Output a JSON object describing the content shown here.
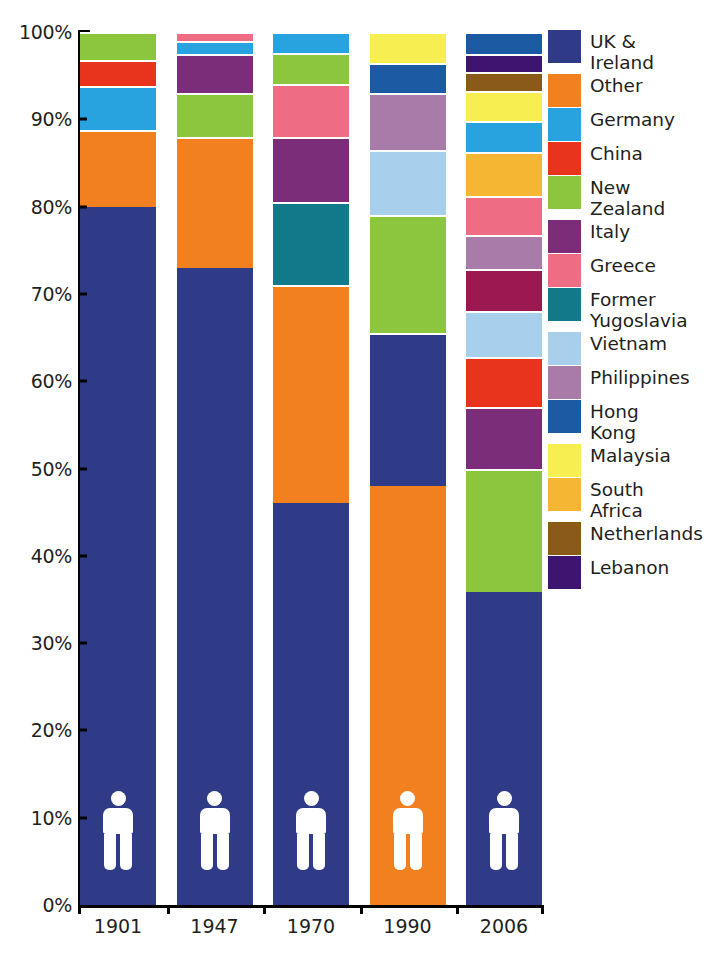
{
  "chart_data": {
    "type": "bar",
    "subtype": "100% stacked column",
    "title": "",
    "xlabel": "",
    "ylabel": "",
    "ylim": [
      0,
      100
    ],
    "grid": false,
    "legend_position": "right",
    "y_tick_labels": [
      "0%",
      "10%",
      "20%",
      "30%",
      "40%",
      "50%",
      "60%",
      "70%",
      "80%",
      "90%",
      "100%"
    ],
    "y_tick_values": [
      0,
      10,
      20,
      30,
      40,
      50,
      60,
      70,
      80,
      90,
      100
    ],
    "categories": [
      "1901",
      "1947",
      "1970",
      "1990",
      "2006"
    ],
    "series": [
      {
        "name": "UK & Ireland",
        "color": "#2f3b86",
        "values": [
          80.0,
          73.0,
          46.0,
          65.5,
          35.8
        ]
      },
      {
        "name": "Other",
        "color": "#f2801f",
        "values": [
          8.8,
          15.0,
          25.0,
          65.5,
          0
        ]
      },
      {
        "name": "Germany",
        "color": "#29a3e0",
        "values": [
          5.0,
          1.7,
          2.0,
          0,
          3.5
        ]
      },
      {
        "name": "China",
        "color": "#e8341c",
        "values": [
          3.0,
          0,
          0,
          0,
          5.8
        ]
      },
      {
        "name": "New Zealand",
        "color": "#8cc63e",
        "values": [
          3.2,
          5.0,
          2.0,
          11.0,
          14.2
        ]
      },
      {
        "name": "Italy",
        "color": "#7b2d7a",
        "values": [
          0,
          4.5,
          4.0,
          0,
          7.0
        ]
      },
      {
        "name": "Greece",
        "color": "#ef6d84",
        "values": [
          0,
          1.0,
          4.0,
          0,
          4.4
        ]
      },
      {
        "name": "Former Yugoslavia",
        "color": "#11798a",
        "values": [
          0,
          0,
          7.5,
          0,
          4.7
        ]
      },
      {
        "name": "Vietnam",
        "color": "#a8d0ec",
        "values": [
          0,
          0,
          0,
          4.0,
          5.3
        ]
      },
      {
        "name": "Philippines",
        "color": "#a87ba8",
        "values": [
          0,
          0,
          0,
          3.5,
          4.0
        ]
      },
      {
        "name": "Hong Kong",
        "color": "#1c5ba4",
        "values": [
          0,
          0,
          0,
          3.0,
          2.3
        ]
      },
      {
        "name": "Malaysia",
        "color": "#f7ee51",
        "values": [
          0,
          0,
          0,
          3.0,
          3.4
        ]
      },
      {
        "name": "South Africa",
        "color": "#f5b733",
        "values": [
          0,
          0,
          0,
          0,
          5.1
        ]
      },
      {
        "name": "Netherlands",
        "color": "#8a5a18",
        "values": [
          0,
          0,
          0,
          0,
          2.2
        ]
      },
      {
        "name": "Lebanon",
        "color": "#3d1470",
        "values": [
          0,
          0,
          0,
          0,
          2.1
        ]
      }
    ],
    "stacks": [
      {
        "category": "1901",
        "segments": [
          {
            "name": "UK & Ireland",
            "color": "#2f3b86",
            "from": 0,
            "to": 80.0
          },
          {
            "name": "Other",
            "color": "#f2801f",
            "from": 80.0,
            "to": 88.8
          },
          {
            "name": "Germany",
            "color": "#29a3e0",
            "from": 88.8,
            "to": 93.8
          },
          {
            "name": "China",
            "color": "#e8341c",
            "from": 93.8,
            "to": 96.8
          },
          {
            "name": "New Zealand",
            "color": "#8cc63e",
            "from": 96.8,
            "to": 100
          }
        ]
      },
      {
        "category": "1947",
        "segments": [
          {
            "name": "UK & Ireland",
            "color": "#2f3b86",
            "from": 0,
            "to": 73.0
          },
          {
            "name": "Other",
            "color": "#f2801f",
            "from": 73.0,
            "to": 88.0
          },
          {
            "name": "New Zealand",
            "color": "#8cc63e",
            "from": 88.0,
            "to": 93.0
          },
          {
            "name": "Italy",
            "color": "#7b2d7a",
            "from": 93.0,
            "to": 97.5
          },
          {
            "name": "Germany",
            "color": "#29a3e0",
            "from": 97.5,
            "to": 99.0
          },
          {
            "name": "Greece",
            "color": "#ef6d84",
            "from": 99.0,
            "to": 100
          }
        ]
      },
      {
        "category": "1970",
        "segments": [
          {
            "name": "UK & Ireland",
            "color": "#2f3b86",
            "from": 0,
            "to": 46.0
          },
          {
            "name": "Other",
            "color": "#f2801f",
            "from": 46.0,
            "to": 71.0
          },
          {
            "name": "Former Yugoslavia",
            "color": "#11798a",
            "from": 71.0,
            "to": 80.5
          },
          {
            "name": "Italy",
            "color": "#7b2d7a",
            "from": 80.5,
            "to": 88.0
          },
          {
            "name": "Greece",
            "color": "#ef6d84",
            "from": 88.0,
            "to": 94.0
          },
          {
            "name": "New Zealand",
            "color": "#8cc63e",
            "from": 94.0,
            "to": 97.6
          },
          {
            "name": "Germany",
            "color": "#29a3e0",
            "from": 97.6,
            "to": 100
          }
        ]
      },
      {
        "category": "1990",
        "segments": [
          {
            "name": "Other",
            "color": "#f2801f",
            "from": 0,
            "to": 48.0
          },
          {
            "name": "UK & Ireland",
            "color": "#2f3b86",
            "from": 48.0,
            "to": 65.5
          },
          {
            "name": "New Zealand",
            "color": "#8cc63e",
            "from": 65.5,
            "to": 79.0
          },
          {
            "name": "Vietnam",
            "color": "#a8d0ec",
            "from": 79.0,
            "to": 86.5
          },
          {
            "name": "Philippines",
            "color": "#a87ba8",
            "from": 86.5,
            "to": 93.0
          },
          {
            "name": "Hong Kong",
            "color": "#1c5ba4",
            "from": 93.0,
            "to": 96.5
          },
          {
            "name": "Malaysia",
            "color": "#f7ee51",
            "from": 96.5,
            "to": 100
          }
        ]
      },
      {
        "category": "2006",
        "segments": [
          {
            "name": "UK & Ireland",
            "color": "#2f3b86",
            "from": 0,
            "to": 35.8
          },
          {
            "name": "New Zealand",
            "color": "#8cc63e",
            "from": 35.8,
            "to": 50.0
          },
          {
            "name": "Italy",
            "color": "#7b2d7a",
            "from": 50.0,
            "to": 57.0
          },
          {
            "name": "China",
            "color": "#e8341c",
            "from": 57.0,
            "to": 62.8
          },
          {
            "name": "Vietnam",
            "color": "#a8d0ec",
            "from": 62.8,
            "to": 68.1
          },
          {
            "name": "Former Yugoslavia",
            "color": "#9c1851",
            "from": 68.1,
            "to": 72.8
          },
          {
            "name": "Philippines",
            "color": "#a87ba8",
            "from": 72.8,
            "to": 76.8
          },
          {
            "name": "Greece",
            "color": "#ef6d84",
            "from": 76.8,
            "to": 81.2
          },
          {
            "name": "South Africa",
            "color": "#f5b733",
            "from": 81.2,
            "to": 86.3
          },
          {
            "name": "Germany",
            "color": "#29a3e0",
            "from": 86.3,
            "to": 89.8
          },
          {
            "name": "Malaysia",
            "color": "#f7ee51",
            "from": 89.8,
            "to": 93.2
          },
          {
            "name": "Netherlands",
            "color": "#8a5a18",
            "from": 93.2,
            "to": 95.4
          },
          {
            "name": "Lebanon",
            "color": "#3d1470",
            "from": 95.4,
            "to": 97.5
          },
          {
            "name": "Hong Kong",
            "color": "#1c5ba4",
            "from": 97.5,
            "to": 100
          }
        ]
      }
    ],
    "annotations": [
      {
        "type": "pictogram",
        "icon": "person-icon",
        "color": "#ffffff",
        "in_category": "1901",
        "at_percent": 9
      },
      {
        "type": "pictogram",
        "icon": "person-icon",
        "color": "#ffffff",
        "in_category": "1947",
        "at_percent": 9
      },
      {
        "type": "pictogram",
        "icon": "person-icon",
        "color": "#ffffff",
        "in_category": "1970",
        "at_percent": 9
      },
      {
        "type": "pictogram",
        "icon": "person-icon",
        "color": "#ffffff",
        "in_category": "1990",
        "at_percent": 9
      },
      {
        "type": "pictogram",
        "icon": "person-icon",
        "color": "#ffffff",
        "in_category": "2006",
        "at_percent": 9
      }
    ]
  },
  "legend": {
    "items": [
      {
        "label": "UK &\nIreland",
        "color": "#2f3b86"
      },
      {
        "label": "Other",
        "color": "#f2801f"
      },
      {
        "label": "Germany",
        "color": "#29a3e0"
      },
      {
        "label": "China",
        "color": "#e8341c"
      },
      {
        "label": "New\nZealand",
        "color": "#8cc63e"
      },
      {
        "label": "Italy",
        "color": "#7b2d7a"
      },
      {
        "label": "Greece",
        "color": "#ef6d84"
      },
      {
        "label": "Former\nYugoslavia",
        "color": "#11798a"
      },
      {
        "label": "Vietnam",
        "color": "#a8d0ec"
      },
      {
        "label": "Philippines",
        "color": "#a87ba8"
      },
      {
        "label": "Hong\nKong",
        "color": "#1c5ba4"
      },
      {
        "label": "Malaysia",
        "color": "#f7ee51"
      },
      {
        "label": "South\nAfrica",
        "color": "#f5b733"
      },
      {
        "label": "Netherlands",
        "color": "#8a5a18"
      },
      {
        "label": "Lebanon",
        "color": "#3d1470"
      }
    ]
  }
}
